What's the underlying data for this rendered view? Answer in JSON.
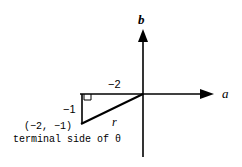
{
  "diagram": {
    "type": "coordinate-plane-reference-triangle",
    "axes": {
      "horizontal_label": "a",
      "vertical_label": "b"
    },
    "point": {
      "label": "(−2, −1)",
      "x": -2,
      "y": -1
    },
    "legs": {
      "horizontal_label": "−2",
      "vertical_label": "−1"
    },
    "hypotenuse_label": "r",
    "caption": "terminal side of θ",
    "colors": {
      "stroke": "#000000",
      "background": "#ffffff"
    }
  }
}
